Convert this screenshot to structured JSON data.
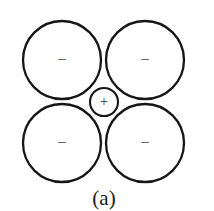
{
  "figure": {
    "caption": "(a)",
    "caption_x": 104,
    "caption_y": 205,
    "background_color": "#ffffff",
    "stroke_color": "#161616",
    "label_color": "#3a3a3a",
    "width": 214,
    "height": 211
  },
  "diagram": {
    "type": "ionic-coordination-packing",
    "anions": [
      {
        "id": "anion-top-left",
        "label": "–",
        "cx": 62,
        "cy": 60,
        "r": 39,
        "label_x": 62,
        "label_y": 60
      },
      {
        "id": "anion-top-right",
        "label": "–",
        "cx": 145,
        "cy": 60,
        "r": 39,
        "label_x": 145,
        "label_y": 60
      },
      {
        "id": "anion-bottom-left",
        "label": "–",
        "cx": 62,
        "cy": 143,
        "r": 39,
        "label_x": 62,
        "label_y": 143
      },
      {
        "id": "anion-bottom-right",
        "label": "–",
        "cx": 145,
        "cy": 143,
        "r": 39,
        "label_x": 145,
        "label_y": 143
      }
    ],
    "cation": {
      "id": "cation-center",
      "label": "+",
      "cx": 104,
      "cy": 102,
      "r": 14,
      "label_x": 104,
      "label_y": 102
    }
  }
}
